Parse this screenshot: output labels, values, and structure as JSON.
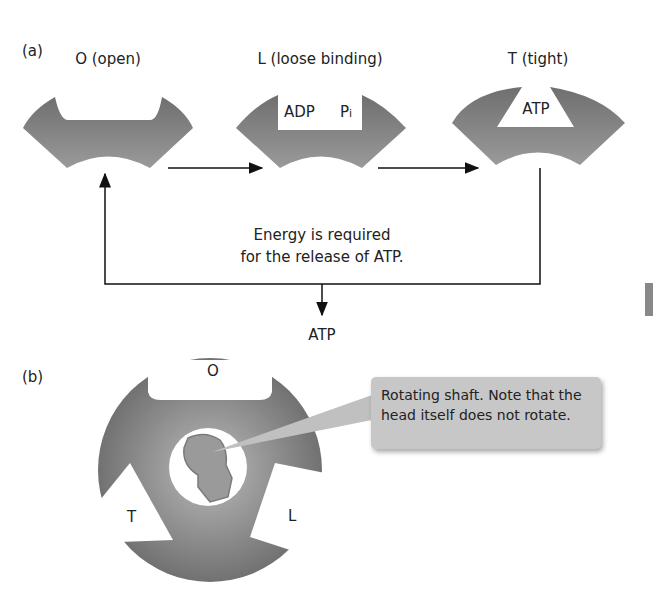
{
  "panel_a": {
    "label": "(a)",
    "states": [
      {
        "name": "O (open)",
        "contents": []
      },
      {
        "name": "L (loose binding)",
        "contents": [
          "ADP",
          "Pi"
        ]
      },
      {
        "name": "T (tight)",
        "contents": [
          "ATP"
        ]
      }
    ],
    "adp": "ADP",
    "pi": "P",
    "pi_sub": "i",
    "atp_bound": "ATP",
    "energy_note_line1": "Energy is required",
    "energy_note_line2": "for the release of ATP.",
    "released_product": "ATP"
  },
  "panel_b": {
    "label": "(b)",
    "site_labels": {
      "top": "O",
      "left": "T",
      "right": "L"
    },
    "callout_text": "Rotating shaft. Note that the head itself does not rotate."
  },
  "colors": {
    "subunit_gray": "#7a7a7a",
    "subunit_light": "#a0a0a0",
    "shaft_gray": "#9a9a9a",
    "callout_bg": "#c7c7c7",
    "arrow": "#111111"
  }
}
